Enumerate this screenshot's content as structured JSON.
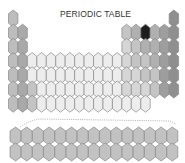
{
  "title": "PERIODIC TABLE",
  "colors": {
    "background": "#ffffff",
    "outline": "#8a8a8a",
    "alkali": "#bdbdbd",
    "alkaline": "#a9a9a9",
    "transition": "#ededed",
    "post_transition": "#d6d6d6",
    "metalloid": "#c4c4c4",
    "nonmetal": "#b0b0b0",
    "halogen": "#9e9e9e",
    "noble": "#8f8f8f",
    "highlight": "#1e1e1e",
    "f_block": "#c2c2c2",
    "connector": "#aaaaaa"
  },
  "main_grid": {
    "columns": 18,
    "rows": 7,
    "cells": [
      [
        1,
        1,
        "alkali"
      ],
      [
        1,
        18,
        "noble"
      ],
      [
        2,
        1,
        "alkali"
      ],
      [
        2,
        2,
        "alkaline"
      ],
      [
        2,
        13,
        "metalloid"
      ],
      [
        2,
        14,
        "nonmetal"
      ],
      [
        2,
        15,
        "highlight"
      ],
      [
        2,
        16,
        "nonmetal"
      ],
      [
        2,
        17,
        "halogen"
      ],
      [
        2,
        18,
        "noble"
      ],
      [
        3,
        1,
        "alkali"
      ],
      [
        3,
        2,
        "alkaline"
      ],
      [
        3,
        13,
        "post_transition"
      ],
      [
        3,
        14,
        "metalloid"
      ],
      [
        3,
        15,
        "nonmetal"
      ],
      [
        3,
        16,
        "nonmetal"
      ],
      [
        3,
        17,
        "halogen"
      ],
      [
        3,
        18,
        "noble"
      ],
      [
        4,
        1,
        "alkali"
      ],
      [
        4,
        2,
        "alkaline"
      ],
      [
        4,
        3,
        "transition"
      ],
      [
        4,
        4,
        "transition"
      ],
      [
        4,
        5,
        "transition"
      ],
      [
        4,
        6,
        "transition"
      ],
      [
        4,
        7,
        "transition"
      ],
      [
        4,
        8,
        "transition"
      ],
      [
        4,
        9,
        "transition"
      ],
      [
        4,
        10,
        "transition"
      ],
      [
        4,
        11,
        "transition"
      ],
      [
        4,
        12,
        "transition"
      ],
      [
        4,
        13,
        "post_transition"
      ],
      [
        4,
        14,
        "metalloid"
      ],
      [
        4,
        15,
        "metalloid"
      ],
      [
        4,
        16,
        "nonmetal"
      ],
      [
        4,
        17,
        "halogen"
      ],
      [
        4,
        18,
        "noble"
      ],
      [
        5,
        1,
        "alkali"
      ],
      [
        5,
        2,
        "alkaline"
      ],
      [
        5,
        3,
        "transition"
      ],
      [
        5,
        4,
        "transition"
      ],
      [
        5,
        5,
        "transition"
      ],
      [
        5,
        6,
        "transition"
      ],
      [
        5,
        7,
        "transition"
      ],
      [
        5,
        8,
        "transition"
      ],
      [
        5,
        9,
        "transition"
      ],
      [
        5,
        10,
        "transition"
      ],
      [
        5,
        11,
        "transition"
      ],
      [
        5,
        12,
        "transition"
      ],
      [
        5,
        13,
        "post_transition"
      ],
      [
        5,
        14,
        "post_transition"
      ],
      [
        5,
        15,
        "metalloid"
      ],
      [
        5,
        16,
        "metalloid"
      ],
      [
        5,
        17,
        "halogen"
      ],
      [
        5,
        18,
        "noble"
      ],
      [
        6,
        1,
        "alkali"
      ],
      [
        6,
        2,
        "alkaline"
      ],
      [
        6,
        3,
        "metalloid"
      ],
      [
        6,
        4,
        "transition"
      ],
      [
        6,
        5,
        "transition"
      ],
      [
        6,
        6,
        "transition"
      ],
      [
        6,
        7,
        "transition"
      ],
      [
        6,
        8,
        "transition"
      ],
      [
        6,
        9,
        "transition"
      ],
      [
        6,
        10,
        "transition"
      ],
      [
        6,
        11,
        "transition"
      ],
      [
        6,
        12,
        "transition"
      ],
      [
        6,
        13,
        "post_transition"
      ],
      [
        6,
        14,
        "post_transition"
      ],
      [
        6,
        15,
        "post_transition"
      ],
      [
        6,
        16,
        "metalloid"
      ],
      [
        6,
        17,
        "halogen"
      ],
      [
        6,
        18,
        "noble"
      ],
      [
        7,
        1,
        "alkali"
      ],
      [
        7,
        2,
        "alkaline"
      ],
      [
        7,
        3,
        "metalloid"
      ],
      [
        7,
        4,
        "transition"
      ],
      [
        7,
        5,
        "transition"
      ],
      [
        7,
        6,
        "transition"
      ],
      [
        7,
        7,
        "transition"
      ],
      [
        7,
        8,
        "transition"
      ],
      [
        7,
        9,
        "transition"
      ],
      [
        7,
        10,
        "transition"
      ],
      [
        7,
        11,
        "transition"
      ],
      [
        7,
        12,
        "transition"
      ],
      [
        7,
        13,
        "transition"
      ],
      [
        7,
        14,
        "transition"
      ],
      [
        7,
        15,
        "transition"
      ]
    ]
  },
  "f_block": {
    "rows": 2,
    "columns": 15,
    "color_key": "f_block"
  }
}
